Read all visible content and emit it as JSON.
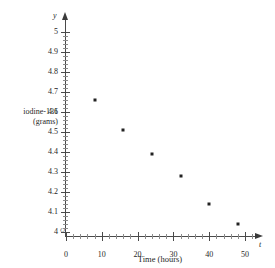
{
  "chart_data": {
    "type": "scatter",
    "title": "",
    "xlabel": "Time (hours)",
    "ylabel_line1": "iodine-131",
    "ylabel_line2": "(grams)",
    "x_variable_symbol": "t",
    "y_variable_symbol": "y",
    "origin_symbol": "O",
    "xlim": [
      0,
      52
    ],
    "ylim": [
      4,
      5.05
    ],
    "x_ticks": [
      0,
      10,
      20,
      30,
      40,
      50
    ],
    "x_tick_labels": [
      "0",
      "10",
      "20",
      "30",
      "40",
      "50"
    ],
    "x_minor_step": 2,
    "y_ticks": [
      4,
      4.1,
      4.2,
      4.3,
      4.4,
      4.5,
      4.6,
      4.7,
      4.8,
      4.9,
      5
    ],
    "y_tick_labels": [
      "4",
      "4.1",
      "4.2",
      "4.3",
      "4.4",
      "4.5",
      "4.6",
      "4.7",
      "4.8",
      "4.9",
      "5"
    ],
    "y_minor_step": 0.02,
    "grid": false,
    "legend": false,
    "x": [
      8,
      16,
      24,
      32,
      40,
      48
    ],
    "y": [
      4.66,
      4.51,
      4.39,
      4.28,
      4.14,
      4.04
    ],
    "points": [
      {
        "x": 8,
        "y": 4.66
      },
      {
        "x": 16,
        "y": 4.51
      },
      {
        "x": 24,
        "y": 4.39
      },
      {
        "x": 32,
        "y": 4.28
      },
      {
        "x": 40,
        "y": 4.14
      },
      {
        "x": 48,
        "y": 4.04
      }
    ],
    "marker_color": "#222222",
    "axis_color": "#4a4a4a"
  }
}
